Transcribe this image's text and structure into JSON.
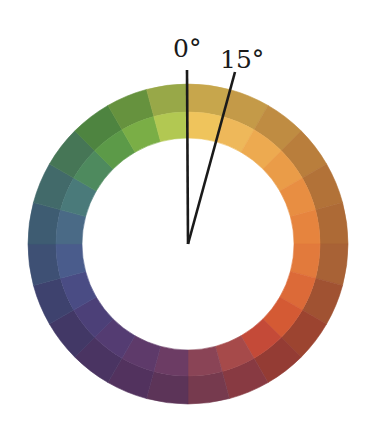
{
  "diagram": {
    "type": "hue-circle",
    "segments_count": 24,
    "segment_angle_deg": 15,
    "center": [
      188,
      244
    ],
    "outer_radius": 160,
    "mid_radius": 132,
    "inner_radius": 106,
    "labels": {
      "zero": "0°",
      "fifteen": "15°"
    },
    "pointer_lines": [
      {
        "name": "zero-degree-line",
        "angle": 0,
        "end": [
          187,
          70
        ]
      },
      {
        "name": "fifteen-degree-line",
        "angle": 15,
        "end": [
          235,
          72
        ]
      }
    ],
    "segments": [
      {
        "inner": "#efc45c",
        "outer": "#c7a64c"
      },
      {
        "inner": "#eeb85a",
        "outer": "#c49a48"
      },
      {
        "inner": "#edaa50",
        "outer": "#bf8c42"
      },
      {
        "inner": "#ea9c48",
        "outer": "#b97e3c"
      },
      {
        "inner": "#e88e42",
        "outer": "#b27238"
      },
      {
        "inner": "#e6843e",
        "outer": "#ad6a36"
      },
      {
        "inner": "#e27a3c",
        "outer": "#a86236"
      },
      {
        "inner": "#dc6a38",
        "outer": "#a05232"
      },
      {
        "inner": "#d45a34",
        "outer": "#9c4430"
      },
      {
        "inner": "#c44a38",
        "outer": "#943c34"
      },
      {
        "inner": "#a64a4a",
        "outer": "#883a42"
      },
      {
        "inner": "#8a4456",
        "outer": "#763a4e"
      },
      {
        "inner": "#6c3c64",
        "outer": "#5c3458"
      },
      {
        "inner": "#5e3a6a",
        "outer": "#52325e"
      },
      {
        "inner": "#543c72",
        "outer": "#4a3462"
      },
      {
        "inner": "#4c4078",
        "outer": "#423866"
      },
      {
        "inner": "#4a4c84",
        "outer": "#3e426e"
      },
      {
        "inner": "#4a5c8c",
        "outer": "#3e5074"
      },
      {
        "inner": "#4a6a86",
        "outer": "#3e5c72"
      },
      {
        "inner": "#4a7a7a",
        "outer": "#426a6a"
      },
      {
        "inner": "#4e8a5e",
        "outer": "#467656"
      },
      {
        "inner": "#5c9a48",
        "outer": "#4e8440"
      },
      {
        "inner": "#7aae46",
        "outer": "#66923e"
      },
      {
        "inner": "#b2c852",
        "outer": "#98a848"
      }
    ]
  }
}
